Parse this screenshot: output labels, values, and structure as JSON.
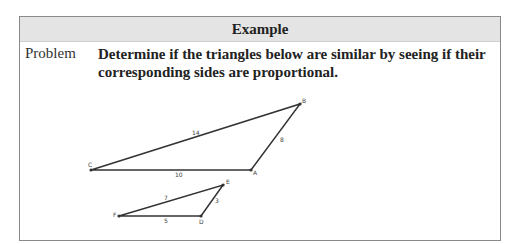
{
  "header": {
    "title": "Example"
  },
  "problem": {
    "label": "Problem",
    "text": "Determine if the triangles below are similar by seeing if their corresponding sides are proportional."
  },
  "figure": {
    "triangle_large": {
      "vertices": {
        "A": "A",
        "B": "B",
        "C": "C"
      },
      "sides": {
        "CB": "14",
        "BA": "8",
        "CA": "10"
      }
    },
    "triangle_small": {
      "vertices": {
        "D": "D",
        "E": "E",
        "F": "F"
      },
      "sides": {
        "FE": "7",
        "ED": "3",
        "FD": "5"
      }
    }
  }
}
